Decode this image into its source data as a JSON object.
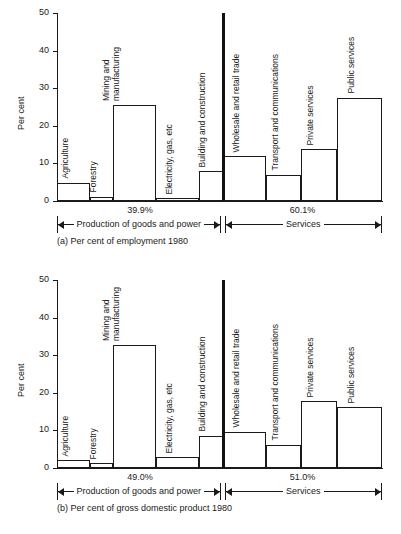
{
  "figure": {
    "axis_label": "Per cent",
    "y_ticks": [
      "0",
      "10",
      "20",
      "30",
      "40",
      "50"
    ],
    "left_bracket_label": "Production of goods and power",
    "right_bracket_label": "Services"
  },
  "chart_data": [
    {
      "type": "bar",
      "id": "a",
      "title": "(a) Per cent of employment 1980",
      "ylabel": "Per cent",
      "xlabel": "",
      "ylim": [
        0,
        50
      ],
      "grid": false,
      "categories": [
        "Agriculture",
        "Forestry",
        "Mining and manufacturing",
        "Electricity, gas, etc",
        "Building and construction",
        "Wholesale and retail trade",
        "Transport and communications",
        "Private services",
        "Public services"
      ],
      "values": [
        4.8,
        1.2,
        25.6,
        0.8,
        7.9,
        11.9,
        7.0,
        13.8,
        27.4
      ],
      "group_split_after_index": 4,
      "annotations": {
        "left_group_pct": "39.9%",
        "right_group_pct": "60.1%",
        "left_group_label": "Production of goods and power",
        "right_group_label": "Services"
      }
    },
    {
      "type": "bar",
      "id": "b",
      "title": "(b) Per cent of gross domestic product 1980",
      "ylabel": "Per cent",
      "xlabel": "",
      "ylim": [
        0,
        50
      ],
      "grid": false,
      "categories": [
        "Agriculture",
        "Forestry",
        "Mining and manufacturing",
        "Electricity, gas, etc",
        "Building and construction",
        "Wholesale and retail trade",
        "Transport and communications",
        "Private services",
        "Public services"
      ],
      "values": [
        2.0,
        1.3,
        32.7,
        2.8,
        8.6,
        9.6,
        6.2,
        17.7,
        16.2
      ],
      "group_split_after_index": 4,
      "annotations": {
        "left_group_pct": "49.0%",
        "right_group_pct": "51.0%",
        "left_group_label": "Production of goods and power",
        "right_group_label": "Services"
      }
    }
  ]
}
